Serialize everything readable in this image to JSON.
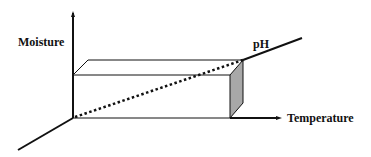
{
  "diagram": {
    "type": "3d-axes-box",
    "axes": {
      "vertical": "Moisture",
      "horizontal": "Temperature",
      "depth": "pH"
    },
    "colors": {
      "line": "#111111",
      "side_face": "#a8a8a8",
      "background": "#ffffff"
    },
    "elements": [
      "rectangular box (prism) spanning from origin",
      "dotted diagonal from origin to far top corner",
      "shaded right side face"
    ]
  }
}
